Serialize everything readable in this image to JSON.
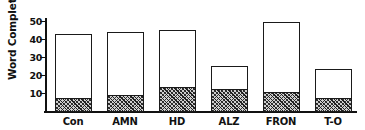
{
  "chart_data": {
    "type": "bar",
    "title": "",
    "xlabel": "",
    "ylabel": "Word Completion (%)",
    "ylim": [
      0,
      52
    ],
    "yticks": [
      10,
      20,
      30,
      40,
      50
    ],
    "ytick_labels": [
      "10",
      "20",
      "30",
      "40",
      "50"
    ],
    "grid": false,
    "legend": null,
    "stacked": true,
    "categories": [
      "Con",
      "AMN",
      "HD",
      "ALZ",
      "FRON",
      "T-O"
    ],
    "series": [
      {
        "name": "hatched-lower-segment",
        "fill": "diagonal-hatch",
        "values": [
          7.0,
          9.0,
          13.5,
          12.0,
          10.5,
          7.0
        ]
      },
      {
        "name": "open-upper-segment",
        "fill": "white",
        "values": [
          36.0,
          35.0,
          32.0,
          13.5,
          39.5,
          17.0
        ]
      }
    ],
    "totals": [
      43.0,
      44.0,
      45.5,
      25.5,
      50.0,
      24.0
    ],
    "colors": {
      "axis": "#111111",
      "bar_outline": "#1a1a1a",
      "bar_open_fill": "#ffffff",
      "bar_hatch_fill": "#cfcfcf",
      "background": "#ffffff"
    }
  }
}
